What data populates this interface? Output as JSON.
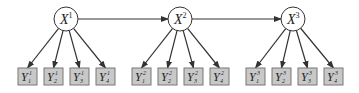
{
  "diagram": {
    "type": "path-diagram",
    "colors": {
      "background": "#ffffff",
      "line": "#333333",
      "circle_fill": "#ffffff",
      "box_fill": "#c8c8c8",
      "box_stroke": "#777777",
      "text": "#222222"
    },
    "latent_nodes": [
      {
        "id": "X1",
        "base": "X",
        "sup": "1",
        "cx": 66,
        "cy": 19
      },
      {
        "id": "X2",
        "base": "X",
        "sup": "2",
        "cx": 180,
        "cy": 19
      },
      {
        "id": "X3",
        "base": "X",
        "sup": "3",
        "cx": 293,
        "cy": 19
      }
    ],
    "observed_nodes": [
      {
        "id": "Y1_1",
        "base": "Y",
        "sup": "1",
        "sub": "1",
        "x": 18,
        "parent": "X1"
      },
      {
        "id": "Y2_1",
        "base": "Y",
        "sup": "1",
        "sub": "2",
        "x": 44,
        "parent": "X1"
      },
      {
        "id": "Y3_1",
        "base": "Y",
        "sup": "1",
        "sub": "3",
        "x": 70,
        "parent": "X1"
      },
      {
        "id": "Y4_1",
        "base": "Y",
        "sup": "1",
        "sub": "4",
        "x": 96,
        "parent": "X1"
      },
      {
        "id": "Y1_2",
        "base": "Y",
        "sup": "2",
        "sub": "1",
        "x": 132,
        "parent": "X2"
      },
      {
        "id": "Y2_2",
        "base": "Y",
        "sup": "2",
        "sub": "2",
        "x": 158,
        "parent": "X2"
      },
      {
        "id": "Y3_2",
        "base": "Y",
        "sup": "2",
        "sub": "3",
        "x": 184,
        "parent": "X2"
      },
      {
        "id": "Y4_2",
        "base": "Y",
        "sup": "2",
        "sub": "4",
        "x": 210,
        "parent": "X2"
      },
      {
        "id": "Y1_3",
        "base": "Y",
        "sup": "3",
        "sub": "1",
        "x": 246,
        "parent": "X3"
      },
      {
        "id": "Y2_3",
        "base": "Y",
        "sup": "3",
        "sub": "2",
        "x": 272,
        "parent": "X3"
      },
      {
        "id": "Y3_3",
        "base": "Y",
        "sup": "3",
        "sub": "3",
        "x": 298,
        "parent": "X3"
      },
      {
        "id": "Y4_3",
        "base": "Y",
        "sup": "3",
        "sub": "4",
        "x": 324,
        "parent": "X3"
      }
    ],
    "edges": [
      {
        "from": "X1",
        "to": "X2"
      },
      {
        "from": "X2",
        "to": "X3"
      }
    ]
  }
}
